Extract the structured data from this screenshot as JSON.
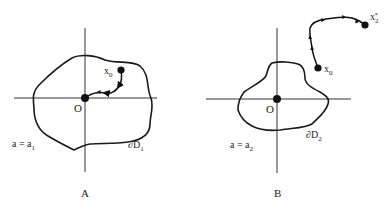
{
  "figure": {
    "panels": [
      {
        "id": "A",
        "caption": "A",
        "origin_label": "O",
        "start_label": "x",
        "start_sub": "0",
        "param_label": "a = a",
        "param_sub": "1",
        "boundary_label": "∂D",
        "boundary_sub": "1",
        "trajectory": "from x0 toward origin O (inside domain)"
      },
      {
        "id": "B",
        "caption": "B",
        "origin_label": "O",
        "start_label": "x",
        "start_sub": "0",
        "end_label": "x",
        "end_sub": "2",
        "end_sup": "*",
        "param_label": "a = a",
        "param_sub": "2",
        "boundary_label": "∂D",
        "boundary_sub": "2",
        "trajectory": "from x0 away to x2* (outside domain)"
      }
    ]
  }
}
